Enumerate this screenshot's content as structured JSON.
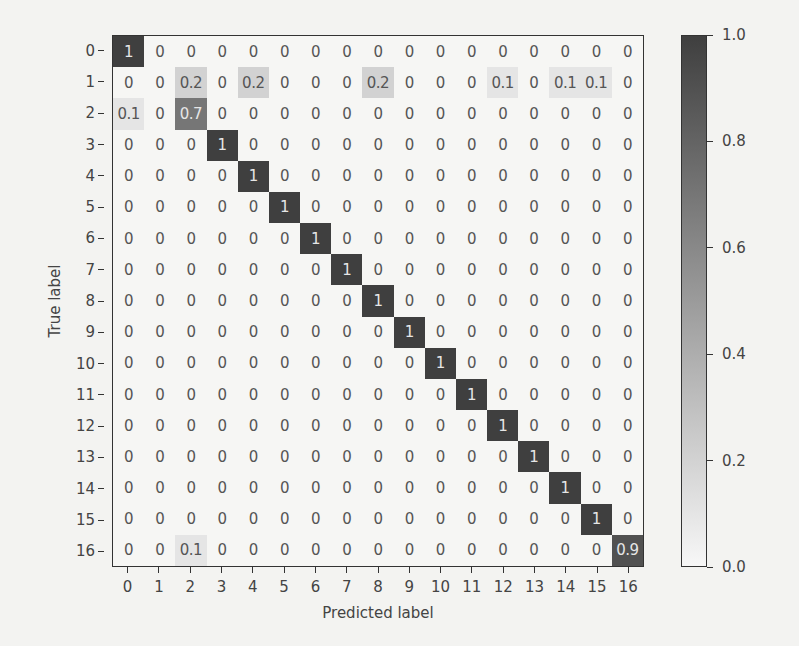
{
  "chart_data": {
    "type": "heatmap",
    "title": "",
    "xlabel": "Predicted label",
    "ylabel": "True label",
    "x_categories": [
      "0",
      "1",
      "2",
      "3",
      "4",
      "5",
      "6",
      "7",
      "8",
      "9",
      "10",
      "11",
      "12",
      "13",
      "14",
      "15",
      "16"
    ],
    "y_categories": [
      "0",
      "1",
      "2",
      "3",
      "4",
      "5",
      "6",
      "7",
      "8",
      "9",
      "10",
      "11",
      "12",
      "13",
      "14",
      "15",
      "16"
    ],
    "values": [
      [
        "1",
        "0",
        "0",
        "0",
        "0",
        "0",
        "0",
        "0",
        "0",
        "0",
        "0",
        "0",
        "0",
        "0",
        "0",
        "0",
        "0"
      ],
      [
        "0",
        "0",
        "0.2",
        "0",
        "0.2",
        "0",
        "0",
        "0",
        "0.2",
        "0",
        "0",
        "0",
        "0.1",
        "0",
        "0.1",
        "0.1",
        "0"
      ],
      [
        "0.1",
        "0",
        "0.7",
        "0",
        "0",
        "0",
        "0",
        "0",
        "0",
        "0",
        "0",
        "0",
        "0",
        "0",
        "0",
        "0",
        "0"
      ],
      [
        "0",
        "0",
        "0",
        "1",
        "0",
        "0",
        "0",
        "0",
        "0",
        "0",
        "0",
        "0",
        "0",
        "0",
        "0",
        "0",
        "0"
      ],
      [
        "0",
        "0",
        "0",
        "0",
        "1",
        "0",
        "0",
        "0",
        "0",
        "0",
        "0",
        "0",
        "0",
        "0",
        "0",
        "0",
        "0"
      ],
      [
        "0",
        "0",
        "0",
        "0",
        "0",
        "1",
        "0",
        "0",
        "0",
        "0",
        "0",
        "0",
        "0",
        "0",
        "0",
        "0",
        "0"
      ],
      [
        "0",
        "0",
        "0",
        "0",
        "0",
        "0",
        "1",
        "0",
        "0",
        "0",
        "0",
        "0",
        "0",
        "0",
        "0",
        "0",
        "0"
      ],
      [
        "0",
        "0",
        "0",
        "0",
        "0",
        "0",
        "0",
        "1",
        "0",
        "0",
        "0",
        "0",
        "0",
        "0",
        "0",
        "0",
        "0"
      ],
      [
        "0",
        "0",
        "0",
        "0",
        "0",
        "0",
        "0",
        "0",
        "1",
        "0",
        "0",
        "0",
        "0",
        "0",
        "0",
        "0",
        "0"
      ],
      [
        "0",
        "0",
        "0",
        "0",
        "0",
        "0",
        "0",
        "0",
        "0",
        "1",
        "0",
        "0",
        "0",
        "0",
        "0",
        "0",
        "0"
      ],
      [
        "0",
        "0",
        "0",
        "0",
        "0",
        "0",
        "0",
        "0",
        "0",
        "0",
        "1",
        "0",
        "0",
        "0",
        "0",
        "0",
        "0"
      ],
      [
        "0",
        "0",
        "0",
        "0",
        "0",
        "0",
        "0",
        "0",
        "0",
        "0",
        "0",
        "1",
        "0",
        "0",
        "0",
        "0",
        "0"
      ],
      [
        "0",
        "0",
        "0",
        "0",
        "0",
        "0",
        "0",
        "0",
        "0",
        "0",
        "0",
        "0",
        "1",
        "0",
        "0",
        "0",
        "0"
      ],
      [
        "0",
        "0",
        "0",
        "0",
        "0",
        "0",
        "0",
        "0",
        "0",
        "0",
        "0",
        "0",
        "0",
        "1",
        "0",
        "0",
        "0"
      ],
      [
        "0",
        "0",
        "0",
        "0",
        "0",
        "0",
        "0",
        "0",
        "0",
        "0",
        "0",
        "0",
        "0",
        "0",
        "1",
        "0",
        "0"
      ],
      [
        "0",
        "0",
        "0",
        "0",
        "0",
        "0",
        "0",
        "0",
        "0",
        "0",
        "0",
        "0",
        "0",
        "0",
        "0",
        "1",
        "0"
      ],
      [
        "0",
        "0",
        "0.1",
        "0",
        "0",
        "0",
        "0",
        "0",
        "0",
        "0",
        "0",
        "0",
        "0",
        "0",
        "0",
        "0",
        "0.9"
      ]
    ],
    "colorbar": {
      "range": [
        0.0,
        1.0
      ],
      "ticks": [
        "0.0",
        "0.2",
        "0.4",
        "0.6",
        "0.8",
        "1.0"
      ],
      "colormap": "greys",
      "low_color": "#f7f7f7",
      "high_color": "#3f3f3f"
    },
    "grid": false,
    "legend_position": "right (colorbar)"
  }
}
